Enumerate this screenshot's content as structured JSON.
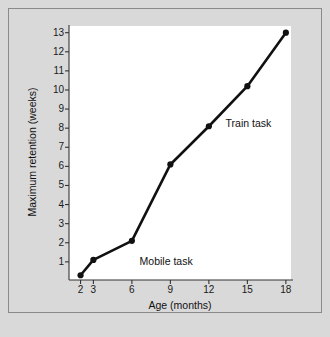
{
  "chart_data": {
    "type": "line",
    "title": "",
    "xlabel": "Age (months)",
    "ylabel": "Maximum retention (weeks)",
    "x": [
      2,
      3,
      6,
      9,
      12,
      15,
      18
    ],
    "values": [
      0.3,
      1.1,
      2.1,
      6.1,
      8.1,
      10.2,
      13.0
    ],
    "series": [
      {
        "name": "Retention",
        "x": [
          2,
          3,
          6,
          9,
          12,
          15,
          18
        ],
        "values": [
          0.3,
          1.1,
          2.1,
          6.1,
          8.1,
          10.2,
          13.0
        ]
      }
    ],
    "xticks": [
      2,
      3,
      6,
      9,
      12,
      15,
      18
    ],
    "xtick_labels": [
      "2",
      "3",
      "6",
      "9",
      "12",
      "15",
      "18"
    ],
    "yticks": [
      1,
      2,
      3,
      4,
      5,
      6,
      7,
      8,
      9,
      10,
      11,
      12,
      13
    ],
    "ytick_labels": [
      "1",
      "2",
      "3",
      "4",
      "5",
      "6",
      "7",
      "8",
      "9",
      "10",
      "11",
      "12",
      "13"
    ],
    "xlim": [
      1.1,
      18.4
    ],
    "ylim": [
      0.05,
      13.35
    ],
    "grid": false,
    "legend": "none",
    "annotations": [
      {
        "text": "Mobile task",
        "x": 6.6,
        "y": 1.05
      },
      {
        "text": "Train task",
        "x": 13.3,
        "y": 8.25
      }
    ],
    "colors": {
      "line": "#111111",
      "marker": "#111111",
      "plot_background": "#ffffff",
      "figure_background": "#d9d9d9",
      "frame_border": "#8a8a8a",
      "axis": "#333333",
      "text": "#111111"
    }
  }
}
